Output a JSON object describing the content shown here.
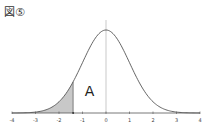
{
  "figure_label": "図⑤",
  "chart_data": {
    "type": "area",
    "title": "図⑤",
    "x_range": [
      -4,
      4
    ],
    "x_ticks": [
      "-4",
      "-3",
      "-2",
      "-1",
      "0",
      "1",
      "2",
      "3",
      "4"
    ],
    "shaded_region": {
      "from": -4,
      "to": -1.4,
      "color": "#c8c8c8"
    },
    "annotation": {
      "text": "A",
      "x": -0.7
    },
    "curve_color": "#555555",
    "grid": false,
    "legend": false
  }
}
